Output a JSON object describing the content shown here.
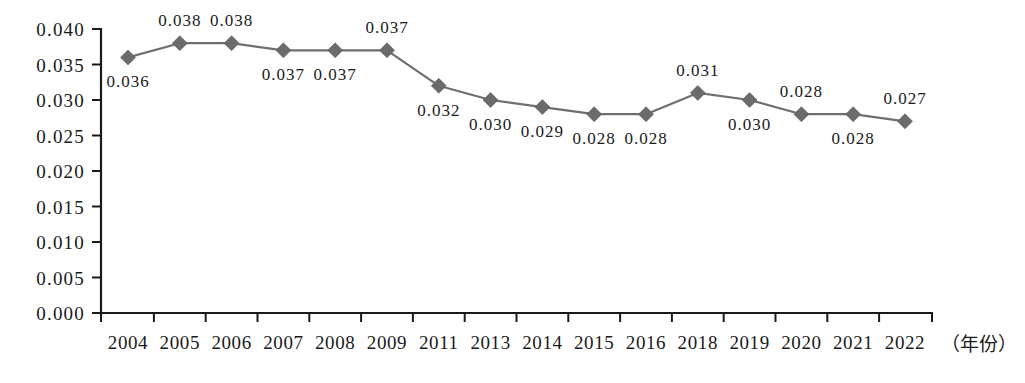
{
  "chart_data": {
    "type": "line",
    "title": "",
    "subtitle": "",
    "xlabel": "（年份）",
    "ylabel": "",
    "x": [
      "2004",
      "2005",
      "2006",
      "2007",
      "2008",
      "2009",
      "2011",
      "2013",
      "2014",
      "2015",
      "2016",
      "2018",
      "2019",
      "2020",
      "2021",
      "2022"
    ],
    "categories": [
      "2004",
      "2005",
      "2006",
      "2007",
      "2008",
      "2009",
      "2011",
      "2013",
      "2014",
      "2015",
      "2016",
      "2018",
      "2019",
      "2020",
      "2021",
      "2022"
    ],
    "values": [
      0.036,
      0.038,
      0.038,
      0.037,
      0.037,
      0.037,
      0.032,
      0.03,
      0.029,
      0.028,
      0.028,
      0.031,
      0.03,
      0.028,
      0.028,
      0.027
    ],
    "point_labels": [
      "0.036",
      "0.038",
      "0.038",
      "0.037",
      "0.037",
      "0.037",
      "0.032",
      "0.030",
      "0.029",
      "0.028",
      "0.028",
      "0.031",
      "0.030",
      "0.028",
      "0.028",
      "0.027"
    ],
    "point_label_placement": [
      "below",
      "above",
      "above",
      "below",
      "below",
      "above",
      "below",
      "below",
      "below",
      "below",
      "below",
      "above",
      "below",
      "above",
      "below",
      "above"
    ],
    "ytick_labels": [
      "0.000",
      "0.005",
      "0.010",
      "0.015",
      "0.020",
      "0.025",
      "0.030",
      "0.035",
      "0.040"
    ],
    "ytick_values": [
      0.0,
      0.005,
      0.01,
      0.015,
      0.02,
      0.025,
      0.03,
      0.035,
      0.04
    ],
    "ylim": [
      0.0,
      0.04
    ],
    "xlim_index": [
      0,
      15
    ],
    "grid": false,
    "legend": null,
    "legend_position": "none",
    "series": [
      {
        "name": "",
        "values": [
          0.036,
          0.038,
          0.038,
          0.037,
          0.037,
          0.037,
          0.032,
          0.03,
          0.029,
          0.028,
          0.028,
          0.031,
          0.03,
          0.028,
          0.028,
          0.027
        ],
        "marker": "diamond",
        "color": "#6b6b6b"
      }
    ],
    "colors": {
      "line": "#6f6f6f",
      "marker": "#6b6b6b",
      "axis": "#1a1a1a",
      "text": "#1a1a1a",
      "background": "#ffffff"
    }
  }
}
